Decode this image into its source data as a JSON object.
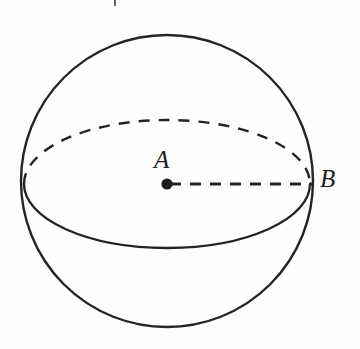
{
  "figure": {
    "kind": "geometry-diagram",
    "width": 360,
    "height": 349,
    "background_color": "#fefefe",
    "stroke_color": "#242424",
    "stroke_width": 2.4
  },
  "sphere": {
    "outline": {
      "center_x": 167,
      "center_y": 181,
      "radius": 146
    },
    "equator": {
      "center_x": 167,
      "center_y": 184,
      "radius_x": 143,
      "radius_y": 64,
      "back_half_style": "dashed",
      "front_half_style": "solid",
      "dash_pattern": "11,9"
    }
  },
  "radius_segment": {
    "style": "dashed",
    "dash_pattern": "11,9",
    "from_x": 170,
    "from_y": 184,
    "to_x": 313,
    "to_y": 184
  },
  "center_point": {
    "x": 167,
    "y": 184,
    "radius": 5.6,
    "fill": "#1d1d1d"
  },
  "labels": {
    "center": "A",
    "surface": "B"
  }
}
